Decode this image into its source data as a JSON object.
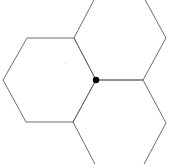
{
  "diagram": {
    "type": "hexagon-tiling",
    "background": "#ffffff",
    "stroke_color": "#6e6e6e",
    "stroke_width": 1,
    "shared_vertex": {
      "x": 96,
      "y": 80,
      "r": 3.2,
      "color": "#000000"
    },
    "hexagons": [
      {
        "name": "left-hexagon",
        "points": "27,38 74,38 96,80 73,122 26,122 3,80"
      },
      {
        "name": "top-right-hexagon",
        "points": "96,-4 143,-4 166,38 143,80 96,80 74,38"
      },
      {
        "name": "bottom-right-hexagon",
        "points": "96,80 143,80 166,123 143,166 96,166 73,122"
      }
    ],
    "faint_mark": {
      "x": 65,
      "y": 63
    }
  }
}
